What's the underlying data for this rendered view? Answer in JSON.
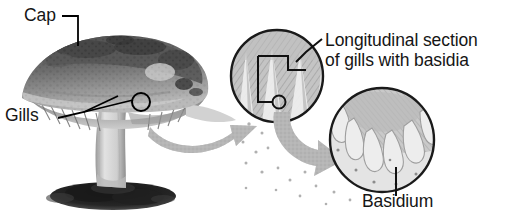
{
  "figure": {
    "background_color": "#ffffff"
  },
  "labels": {
    "cap": "Cap",
    "gills": "Gills",
    "longitudinal_line1": "Longitudinal section",
    "longitudinal_line2": "of gills with basidia",
    "basidium": "Basidium"
  },
  "colors": {
    "text": "#151515",
    "leader_line": "#000000",
    "arrow_fill": "#b4b4b4",
    "circle_outline": "#1a1a1a",
    "gill_tissue": "#b8b8b8",
    "basidia_cell": "#d8d8d8",
    "soil": "#2b2b2b",
    "cap_dark": "#4a4a4a",
    "stem_light": "#d5d5d5"
  },
  "elements": {
    "mushroom_photo": "grayscale photograph of a mushroom with scaly cap, gills and stem on soil",
    "callout_marker_on_mushroom": "small circle outline marking gill region",
    "magnification_circle_1": "longitudinal section of gills showing tissue",
    "magnification_circle_2": "close-up of basidia club-shaped cells",
    "arrow_1": "curved gray arrow from mushroom to first circle",
    "arrow_2": "curved gray arrow from first circle to second circle",
    "spores": "scattered small spore dots below the circles"
  }
}
